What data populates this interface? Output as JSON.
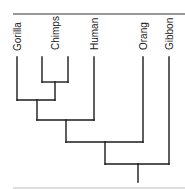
{
  "diagram": {
    "type": "phylogenetic-tree",
    "leaves": [
      {
        "label": "Gorilla",
        "x": 17
      },
      {
        "label": "Chimps",
        "x": 42
      },
      {
        "label": "Chimps",
        "x": 68
      },
      {
        "label": "Human",
        "x": 94
      },
      {
        "label": "Orang",
        "x": 143
      },
      {
        "label": "Gibbon",
        "x": 169
      }
    ],
    "labels": {
      "gorilla": "Gorilla",
      "chimps": "Chimps",
      "human": "Human",
      "orang": "Orang",
      "gibbon": "Gibbon"
    },
    "clades": [
      "(Chimps, Chimps)",
      "(Gorilla, (Chimps))",
      "((Gorilla, Chimps), Human)",
      "(((Gorilla, Chimps), Human), Orang)",
      "((((Gorilla, Chimps), Human), Orang), Gibbon)"
    ],
    "colors": {
      "line": "#1a1a1a",
      "rule_top": "#333333",
      "rule_bottom": "#bbbbbb",
      "background": "#ffffff"
    }
  }
}
